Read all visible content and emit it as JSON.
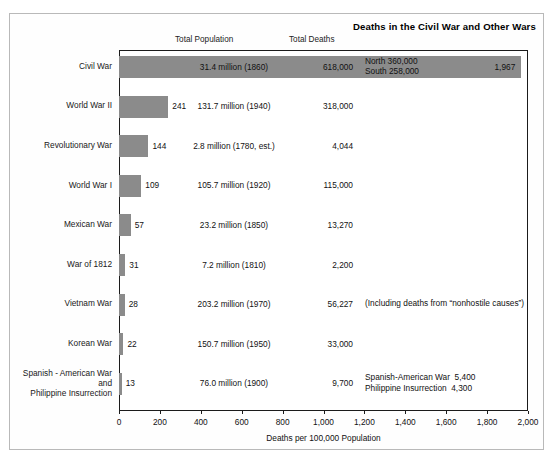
{
  "chart_data": {
    "type": "bar",
    "orientation": "horizontal",
    "title": "Deaths in the Civil War and Other Wars",
    "xlabel": "Deaths per 100,000 Population",
    "ylabel": "",
    "xlim": [
      0,
      2000
    ],
    "xticks": [
      0,
      200,
      400,
      600,
      800,
      1000,
      1200,
      1400,
      1600,
      1800,
      2000
    ],
    "xtick_labels": [
      "0",
      "200",
      "400",
      "600",
      "800",
      "1,000",
      "1,200",
      "1,400",
      "1,600",
      "1,800",
      "2,000"
    ],
    "grid": false,
    "legend": null,
    "column_headers": [
      "Total Population",
      "Total Deaths"
    ],
    "categories": [
      "Civil War",
      "World War II",
      "Revolutionary War",
      "World War I",
      "Mexican War",
      "War of 1812",
      "Vietnam War",
      "Korean War",
      "Spanish - American War and Philippine Insurrection"
    ],
    "values": [
      1967,
      241,
      144,
      109,
      57,
      31,
      28,
      22,
      13
    ],
    "value_labels": [
      "1,967",
      "241",
      "144",
      "109",
      "57",
      "31",
      "28",
      "22",
      "13"
    ],
    "series": [
      {
        "name": "Deaths per 100,000 Population",
        "values": [
          1967,
          241,
          144,
          109,
          57,
          31,
          28,
          22,
          13
        ]
      }
    ],
    "total_population": [
      "31.4 million (1860)",
      "131.7 million (1940)",
      "2.8 million (1780, est.)",
      "105.7 million (1920)",
      "23.2 million (1850)",
      "7.2 million (1810)",
      "203.2 million (1970)",
      "150.7 million (1950)",
      "76.0 million (1900)"
    ],
    "total_deaths": [
      "618,000",
      "318,000",
      "4,044",
      "115,000",
      "13,270",
      "2,200",
      "56,227",
      "33,000",
      "9,700"
    ],
    "annotations": [
      "North 360,000\nSouth 258,000",
      "",
      "",
      "",
      "",
      "",
      "(Including deaths from “nonhostile causes”)",
      "",
      "Spanish-American War  5,400\nPhilippine Insurrection  4,300"
    ],
    "bar_color": "#8b8b8b",
    "frame_color": "#1b1b1b"
  },
  "rows": [
    {
      "name": "Civil War",
      "name_lines": [
        "Civil War"
      ],
      "value": 1967,
      "value_label": "1,967",
      "population": "31.4 million (1860)",
      "deaths": "618,000",
      "note": "North 360,000\nSouth 258,000"
    },
    {
      "name": "World War II",
      "name_lines": [
        "World War II"
      ],
      "value": 241,
      "value_label": "241",
      "population": "131.7 million (1940)",
      "deaths": "318,000",
      "note": ""
    },
    {
      "name": "Revolutionary War",
      "name_lines": [
        "Revolutionary War"
      ],
      "value": 144,
      "value_label": "144",
      "population": "2.8 million (1780, est.)",
      "deaths": "4,044",
      "note": ""
    },
    {
      "name": "World War I",
      "name_lines": [
        "World War I"
      ],
      "value": 109,
      "value_label": "109",
      "population": "105.7 million (1920)",
      "deaths": "115,000",
      "note": ""
    },
    {
      "name": "Mexican War",
      "name_lines": [
        "Mexican War"
      ],
      "value": 57,
      "value_label": "57",
      "population": "23.2 million (1850)",
      "deaths": "13,270",
      "note": ""
    },
    {
      "name": "War of 1812",
      "name_lines": [
        "War of 1812"
      ],
      "value": 31,
      "value_label": "31",
      "population": "7.2 million (1810)",
      "deaths": "2,200",
      "note": ""
    },
    {
      "name": "Vietnam War",
      "name_lines": [
        "Vietnam War"
      ],
      "value": 28,
      "value_label": "28",
      "population": "203.2 million (1970)",
      "deaths": "56,227",
      "note": "(Including deaths from “nonhostile causes”)"
    },
    {
      "name": "Korean War",
      "name_lines": [
        "Korean War"
      ],
      "value": 22,
      "value_label": "22",
      "population": "150.7 million (1950)",
      "deaths": "33,000",
      "note": ""
    },
    {
      "name": "Spanish - American War and Philippine Insurrection",
      "name_lines": [
        "Spanish - American War",
        "and",
        "Philippine Insurrection"
      ],
      "value": 13,
      "value_label": "13",
      "population": "76.0 million (1900)",
      "deaths": "9,700",
      "note": "Spanish-American War  5,400\nPhilippine Insurrection  4,300"
    }
  ],
  "header": {
    "title": "Deaths in the Civil War and Other Wars",
    "col_population": "Total Population",
    "col_deaths": "Total Deaths"
  },
  "axis": {
    "title": "Deaths per 100,000 Population",
    "tick_labels": [
      "0",
      "200",
      "400",
      "600",
      "800",
      "1,000",
      "1,200",
      "1,400",
      "1,600",
      "1,800",
      "2,000"
    ]
  }
}
